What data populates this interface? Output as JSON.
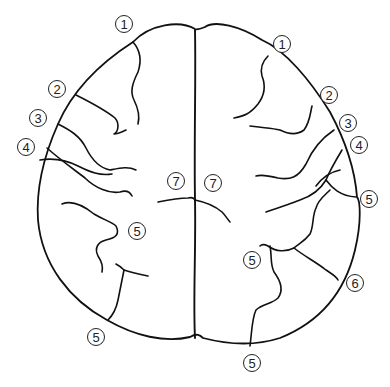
{
  "figure": {
    "stroke_color": "#111111",
    "background": "#ffffff"
  },
  "labels": [
    {
      "id": "L1a",
      "text": "1",
      "x": 124,
      "y": 24
    },
    {
      "id": "L1b",
      "text": "1",
      "x": 282,
      "y": 44
    },
    {
      "id": "L2a",
      "text": "2",
      "x": 57,
      "y": 89
    },
    {
      "id": "L2b",
      "text": "2",
      "x": 329,
      "y": 95
    },
    {
      "id": "L3a",
      "text": "3",
      "x": 38,
      "y": 118
    },
    {
      "id": "L3b",
      "text": "3",
      "x": 348,
      "y": 123
    },
    {
      "id": "L4a",
      "text": "4",
      "x": 26,
      "y": 147
    },
    {
      "id": "L4b",
      "text": "4",
      "x": 359,
      "y": 145
    },
    {
      "id": "L5a",
      "text": "5",
      "x": 369,
      "y": 199
    },
    {
      "id": "L5b",
      "text": "5",
      "x": 137,
      "y": 231
    },
    {
      "id": "L5c",
      "text": "5",
      "x": 252,
      "y": 260
    },
    {
      "id": "L5d",
      "text": "5",
      "x": 96,
      "y": 337
    },
    {
      "id": "L5e",
      "text": "5",
      "x": 252,
      "y": 363
    },
    {
      "id": "L6",
      "text": "6",
      "x": 355,
      "y": 283
    },
    {
      "id": "L7a",
      "text": "7",
      "x": 176,
      "y": 181
    },
    {
      "id": "L7b",
      "text": "7",
      "x": 213,
      "y": 183
    }
  ]
}
